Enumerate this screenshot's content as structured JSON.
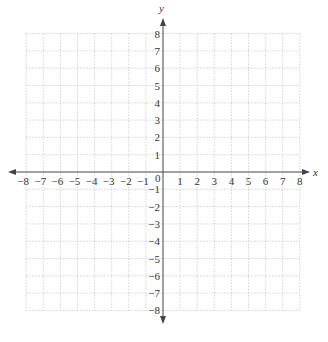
{
  "diagram": {
    "type": "coordinate-plane",
    "x_axis": {
      "label": "x",
      "min": -8,
      "max": 8,
      "step": 1
    },
    "y_axis": {
      "label": "y",
      "min": -8,
      "max": 8,
      "step": 1
    },
    "origin_label": "0",
    "x_tick_labels": [
      "-8",
      "-7",
      "-6",
      "-5",
      "-4",
      "-3",
      "-2",
      "-1",
      "1",
      "2",
      "3",
      "4",
      "5",
      "6",
      "7",
      "8"
    ],
    "y_tick_labels": [
      "8",
      "7",
      "6",
      "5",
      "4",
      "3",
      "2",
      "1",
      "-1",
      "-2",
      "-3",
      "-4",
      "-5",
      "-6",
      "-7",
      "-8"
    ],
    "grid": {
      "style": "dotted",
      "color": "#c8c8c8"
    },
    "axis_color": "#444444"
  }
}
